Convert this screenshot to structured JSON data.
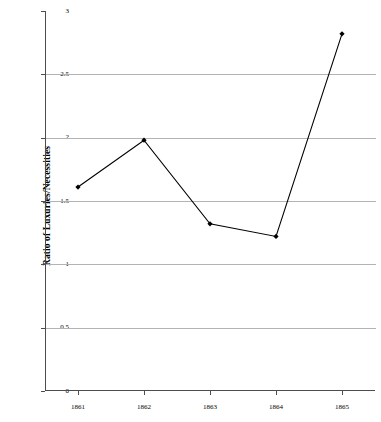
{
  "chart_data": {
    "type": "line",
    "title": "",
    "xlabel": "",
    "ylabel": "Ratio of Luxuries/Necessities",
    "categories": [
      "1861",
      "1862",
      "1863",
      "1864",
      "1865"
    ],
    "values": [
      1.61,
      1.98,
      1.32,
      1.22,
      2.82
    ],
    "series": [
      {
        "name": "Ratio of Luxuries/Necessities",
        "values": [
          1.61,
          1.98,
          1.32,
          1.22,
          2.82
        ]
      }
    ],
    "ylim": [
      0,
      3
    ],
    "yticks": [
      "0",
      "0.5",
      "1",
      "1.5",
      "2",
      "2.5",
      "3"
    ],
    "ytick_values": [
      0,
      0.5,
      1,
      1.5,
      2,
      2.5,
      3
    ],
    "grid": true,
    "legend": "none",
    "marker": "filled-diamond",
    "line_color": "#000000",
    "grid_color": "#b3b3b3",
    "axis_color": "#4d4d4d",
    "background_color": "#ffffff"
  },
  "axis": {
    "y_title": "Ratio of Luxuries/Necessities"
  }
}
